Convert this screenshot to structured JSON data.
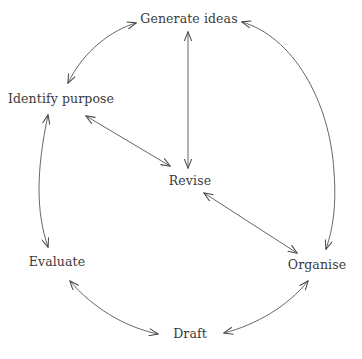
{
  "diagram": {
    "type": "cycle-diagram",
    "background_color": "#ffffff",
    "line_color": "#5a5a5a",
    "text_color": "#3a3a3a",
    "nodes": [
      {
        "id": "generate-ideas",
        "label": "Generate ideas",
        "x": 189,
        "y": 19,
        "position": "top"
      },
      {
        "id": "identify-purpose",
        "label": "Identify purpose",
        "x": 61,
        "y": 99,
        "position": "upper-left"
      },
      {
        "id": "revise",
        "label": "Revise",
        "x": 190,
        "y": 181,
        "position": "center"
      },
      {
        "id": "evaluate",
        "label": "Evaluate",
        "x": 57,
        "y": 262,
        "position": "lower-left"
      },
      {
        "id": "organise",
        "label": "Organise",
        "x": 317,
        "y": 265,
        "position": "lower-right"
      },
      {
        "id": "draft",
        "label": "Draft",
        "x": 190,
        "y": 334,
        "position": "bottom"
      }
    ],
    "connections": [
      {
        "id": "identify-purpose--generate-ideas",
        "from": "Identify purpose",
        "to": "Generate ideas",
        "style": "curved",
        "arrowheads": "both"
      },
      {
        "id": "generate-ideas--organise",
        "from": "Generate ideas",
        "to": "Organise",
        "style": "curved",
        "arrowheads": "both"
      },
      {
        "id": "organise--draft",
        "from": "Organise",
        "to": "Draft",
        "style": "curved",
        "arrowheads": "both"
      },
      {
        "id": "draft--evaluate",
        "from": "Draft",
        "to": "Evaluate",
        "style": "curved",
        "arrowheads": "both"
      },
      {
        "id": "evaluate--identify-purpose",
        "from": "Evaluate",
        "to": "Identify purpose",
        "style": "curved",
        "arrowheads": "both"
      },
      {
        "id": "generate-ideas--revise",
        "from": "Generate ideas",
        "to": "Revise",
        "style": "straight",
        "arrowheads": "both"
      },
      {
        "id": "identify-purpose--revise",
        "from": "Identify purpose",
        "to": "Revise",
        "style": "straight",
        "arrowheads": "both"
      },
      {
        "id": "revise--organise",
        "from": "Revise",
        "to": "Organise",
        "style": "straight",
        "arrowheads": "both"
      }
    ]
  }
}
